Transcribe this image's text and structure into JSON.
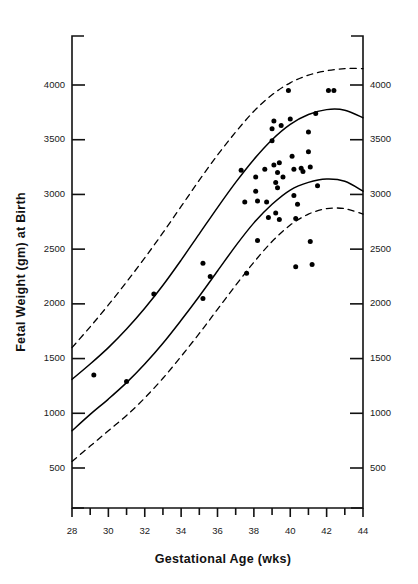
{
  "chart_data": {
    "type": "scatter",
    "title": "",
    "subtitle": "",
    "xlabel": "Gestational Age (wks)",
    "ylabel": "Fetal Weight (gm) at Birth",
    "ylabel_right": "Fetal Weight (gm) at Birth",
    "xlim": [
      28,
      44
    ],
    "ylim": [
      200,
      4450
    ],
    "grid": false,
    "legend": "none",
    "x_ticks_major": [
      28,
      30,
      32,
      34,
      36,
      38,
      40,
      42,
      44
    ],
    "x_ticks_minor": [
      29,
      31,
      33,
      35,
      37,
      39,
      41,
      43
    ],
    "x_tick_labels": [
      "28",
      "30",
      "32",
      "34",
      "36",
      "38",
      "40",
      "42",
      "44"
    ],
    "y_ticks": [
      500,
      1000,
      1500,
      2000,
      2500,
      3000,
      3500,
      4000
    ],
    "y_tick_labels_left": [
      "500",
      "1000",
      "1500",
      "2000",
      "2500",
      "3000",
      "3500",
      "4000"
    ],
    "y_tick_labels_right": [
      "500",
      "1000",
      "1500",
      "2000",
      "2500",
      "3000",
      "3500",
      "4000"
    ],
    "axes": {
      "left_axis": "y-axis-left",
      "right_axis": "y-axis-right",
      "bottom_axis": "x-axis",
      "top_border": false
    },
    "series": [
      {
        "name": "upper-dashed-percentile",
        "type": "line",
        "style": "dashed",
        "color": "#000000",
        "x": [
          28,
          29,
          30,
          31,
          32,
          33,
          34,
          35,
          36,
          37,
          38,
          39,
          40,
          41,
          42,
          43,
          44
        ],
        "y": [
          1600,
          1790,
          1990,
          2200,
          2420,
          2650,
          2890,
          3130,
          3360,
          3570,
          3760,
          3910,
          4020,
          4090,
          4130,
          4150,
          4150
        ]
      },
      {
        "name": "upper-solid-percentile",
        "type": "line",
        "style": "solid",
        "color": "#000000",
        "x": [
          28,
          29,
          30,
          31,
          32,
          33,
          34,
          35,
          36,
          37,
          38,
          39,
          40,
          41,
          42,
          43,
          44
        ],
        "y": [
          1310,
          1450,
          1600,
          1770,
          1960,
          2170,
          2400,
          2640,
          2880,
          3110,
          3320,
          3500,
          3640,
          3730,
          3775,
          3770,
          3700
        ]
      },
      {
        "name": "lower-solid-percentile",
        "type": "line",
        "style": "solid",
        "color": "#000000",
        "x": [
          28,
          29,
          30,
          31,
          32,
          33,
          34,
          35,
          36,
          37,
          38,
          39,
          40,
          41,
          42,
          43,
          44
        ],
        "y": [
          840,
          990,
          1130,
          1280,
          1450,
          1640,
          1850,
          2070,
          2300,
          2530,
          2740,
          2910,
          3040,
          3110,
          3140,
          3120,
          3030
        ]
      },
      {
        "name": "lower-dashed-percentile",
        "type": "line",
        "style": "dashed",
        "color": "#000000",
        "x": [
          28,
          29,
          30,
          31,
          32,
          33,
          34,
          35,
          36,
          37,
          38,
          39,
          40,
          41,
          42,
          43,
          44
        ],
        "y": [
          560,
          700,
          840,
          980,
          1140,
          1320,
          1520,
          1730,
          1950,
          2170,
          2380,
          2570,
          2720,
          2820,
          2870,
          2870,
          2820
        ]
      }
    ],
    "scatter_points": [
      {
        "x": 29.2,
        "y": 1350
      },
      {
        "x": 31.0,
        "y": 1290
      },
      {
        "x": 32.5,
        "y": 2090
      },
      {
        "x": 35.2,
        "y": 2370
      },
      {
        "x": 35.2,
        "y": 2050
      },
      {
        "x": 35.6,
        "y": 2250
      },
      {
        "x": 37.3,
        "y": 3220
      },
      {
        "x": 37.5,
        "y": 2930
      },
      {
        "x": 37.6,
        "y": 2280
      },
      {
        "x": 38.1,
        "y": 3160
      },
      {
        "x": 38.1,
        "y": 3030
      },
      {
        "x": 38.2,
        "y": 2940
      },
      {
        "x": 38.2,
        "y": 2580
      },
      {
        "x": 38.6,
        "y": 3230
      },
      {
        "x": 38.7,
        "y": 2930
      },
      {
        "x": 38.8,
        "y": 2790
      },
      {
        "x": 39.0,
        "y": 3600
      },
      {
        "x": 39.0,
        "y": 3490
      },
      {
        "x": 39.1,
        "y": 3670
      },
      {
        "x": 39.1,
        "y": 3270
      },
      {
        "x": 39.2,
        "y": 3110
      },
      {
        "x": 39.2,
        "y": 2830
      },
      {
        "x": 39.3,
        "y": 3200
      },
      {
        "x": 39.3,
        "y": 3060
      },
      {
        "x": 39.4,
        "y": 3290
      },
      {
        "x": 39.4,
        "y": 2770
      },
      {
        "x": 39.5,
        "y": 3630
      },
      {
        "x": 39.6,
        "y": 3160
      },
      {
        "x": 39.9,
        "y": 3950
      },
      {
        "x": 40.0,
        "y": 3690
      },
      {
        "x": 40.1,
        "y": 3350
      },
      {
        "x": 40.2,
        "y": 3230
      },
      {
        "x": 40.2,
        "y": 2990
      },
      {
        "x": 40.3,
        "y": 2780
      },
      {
        "x": 40.3,
        "y": 2340
      },
      {
        "x": 40.4,
        "y": 2910
      },
      {
        "x": 40.6,
        "y": 3240
      },
      {
        "x": 40.7,
        "y": 3210
      },
      {
        "x": 41.0,
        "y": 3570
      },
      {
        "x": 41.0,
        "y": 3390
      },
      {
        "x": 41.1,
        "y": 3250
      },
      {
        "x": 41.1,
        "y": 2570
      },
      {
        "x": 41.2,
        "y": 2360
      },
      {
        "x": 41.4,
        "y": 3740
      },
      {
        "x": 41.5,
        "y": 3080
      },
      {
        "x": 42.1,
        "y": 3950
      },
      {
        "x": 42.4,
        "y": 3950
      }
    ]
  }
}
